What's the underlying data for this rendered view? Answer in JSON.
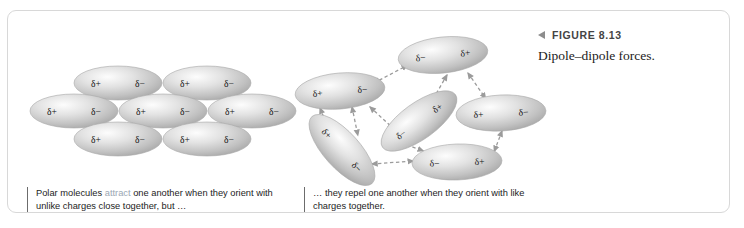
{
  "figure": {
    "marker_icon": "triangle-left-icon",
    "label": "FIGURE 8.13",
    "caption": "Dipole–dipole forces."
  },
  "captions": {
    "left": {
      "part1": "Polar molecules ",
      "highlight": "attract",
      "part2": " one another when they orient with unlike charges close together, but …",
      "highlight_color": "#9aa7b4"
    },
    "right": {
      "text": "… they repel one another when they orient with like charges together."
    }
  },
  "charges": {
    "positive": "δ+",
    "negative": "δ−"
  },
  "panels": {
    "attract": {
      "name": "aligned-dipoles-cluster",
      "molecule_count": 7,
      "molecules": [
        {
          "id": "a1",
          "cx": 110,
          "cy": 72,
          "rx": 44,
          "ry": 17,
          "rot": 0,
          "pos_label": "δ+",
          "neg_label": "δ−"
        },
        {
          "id": "a2",
          "cx": 199,
          "cy": 72,
          "rx": 44,
          "ry": 17,
          "rot": 0,
          "pos_label": "δ+",
          "neg_label": "δ−"
        },
        {
          "id": "a3",
          "cx": 66,
          "cy": 100,
          "rx": 44,
          "ry": 17,
          "rot": 0,
          "pos_label": "δ+",
          "neg_label": "δ−"
        },
        {
          "id": "a4",
          "cx": 155,
          "cy": 100,
          "rx": 44,
          "ry": 17,
          "rot": 0,
          "pos_label": "δ+",
          "neg_label": "δ−"
        },
        {
          "id": "a5",
          "cx": 244,
          "cy": 100,
          "rx": 44,
          "ry": 17,
          "rot": 0,
          "pos_label": "δ+",
          "neg_label": "δ−"
        },
        {
          "id": "a6",
          "cx": 110,
          "cy": 128,
          "rx": 44,
          "ry": 17,
          "rot": 0,
          "pos_label": "δ+",
          "neg_label": "δ−"
        },
        {
          "id": "a7",
          "cx": 199,
          "cy": 128,
          "rx": 44,
          "ry": 17,
          "rot": 0,
          "pos_label": "δ+",
          "neg_label": "δ−"
        }
      ]
    },
    "repel": {
      "name": "disordered-dipoles-cluster",
      "molecule_count": 6,
      "molecules": [
        {
          "id": "r1",
          "cx": 435,
          "cy": 44,
          "rx": 45,
          "ry": 18,
          "rot": -6,
          "left_label": "δ−",
          "right_label": "δ+"
        },
        {
          "id": "r2",
          "cx": 332,
          "cy": 80,
          "rx": 45,
          "ry": 18,
          "rot": -5,
          "left_label": "δ+",
          "right_label": "δ−"
        },
        {
          "id": "r3",
          "cx": 411,
          "cy": 110,
          "rx": 45,
          "ry": 18,
          "rot": -36,
          "left_label": "δ−",
          "right_label": "δ+"
        },
        {
          "id": "r4",
          "cx": 493,
          "cy": 102,
          "rx": 45,
          "ry": 18,
          "rot": -3,
          "left_label": "δ+",
          "right_label": "δ−"
        },
        {
          "id": "r5",
          "cx": 334,
          "cy": 139,
          "rx": 45,
          "ry": 18,
          "rot": 48,
          "left_label": "δ+",
          "right_label": "δ−"
        },
        {
          "id": "r6",
          "cx": 449,
          "cy": 151,
          "rx": 45,
          "ry": 18,
          "rot": -2,
          "left_label": "δ−",
          "right_label": "δ+"
        }
      ],
      "force_lines": [
        {
          "x1": 366,
          "y1": 72,
          "x2": 400,
          "y2": 54
        },
        {
          "x1": 460,
          "y1": 62,
          "x2": 478,
          "y2": 88
        },
        {
          "x1": 439,
          "y1": 64,
          "x2": 424,
          "y2": 90
        },
        {
          "x1": 312,
          "y1": 97,
          "x2": 322,
          "y2": 122
        },
        {
          "x1": 344,
          "y1": 96,
          "x2": 350,
          "y2": 125
        },
        {
          "x1": 362,
          "y1": 96,
          "x2": 386,
          "y2": 118
        },
        {
          "x1": 455,
          "y1": 106,
          "x2": 472,
          "y2": 104
        },
        {
          "x1": 494,
          "y1": 120,
          "x2": 486,
          "y2": 141
        },
        {
          "x1": 364,
          "y1": 153,
          "x2": 406,
          "y2": 150
        },
        {
          "x1": 393,
          "y1": 132,
          "x2": 416,
          "y2": 140
        }
      ]
    }
  }
}
